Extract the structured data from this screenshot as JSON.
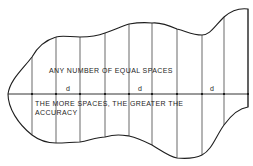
{
  "diagram": {
    "type": "area-by-equal-divisions",
    "colors": {
      "stroke": "#1e1e1e",
      "background": "#ffffff"
    },
    "caption_top": "ANY NUMBER OF EQUAL SPACES",
    "caption_bottom_line1": "THE MORE SPACES, THE GREATER THE",
    "caption_bottom_line2": "ACCURACY",
    "spacing_labels": [
      "d",
      "d",
      "d"
    ],
    "baseline_y": 94,
    "ordinates": [
      {
        "x": 32,
        "top": 57,
        "bottom": 135
      },
      {
        "x": 56,
        "top": 37,
        "bottom": 143
      },
      {
        "x": 80,
        "top": 37,
        "bottom": 142
      },
      {
        "x": 105,
        "top": 33,
        "bottom": 138
      },
      {
        "x": 129,
        "top": 24,
        "bottom": 136
      },
      {
        "x": 152,
        "top": 23,
        "bottom": 145
      },
      {
        "x": 177,
        "top": 32,
        "bottom": 158
      },
      {
        "x": 202,
        "top": 35,
        "bottom": 155
      },
      {
        "x": 224,
        "top": 17,
        "bottom": 125
      },
      {
        "x": 248,
        "top": 9,
        "bottom": 107
      }
    ]
  }
}
